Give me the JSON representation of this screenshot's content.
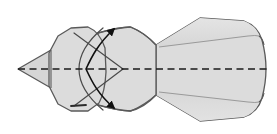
{
  "figure": {
    "description": "Line drawing of a folded paper form with a pointed left tip, a rounded octagonal head, a pinched waist and a flared fan-shaped tail at the right. A dashed horizontal centre line runs the full width and a curved double-headed arrow indicates the fold rotation.",
    "canvas": {
      "width": 277,
      "height": 134
    },
    "colors": {
      "background": "#ffffff",
      "paper_fill": "#dcdcdc",
      "paper_fill_light": "#e2e2e2",
      "paper_fill_shadow": "#d2d2d2",
      "outline": "#5a5a5a",
      "crease_line": "#9a9a9a",
      "arrow": "#111111",
      "center_line": "#1a1a1a"
    },
    "elements": [
      {
        "name": "left-tip-triangle",
        "kind": "filled-polygon",
        "label": "Pointed left tip",
        "points": "18,69 50,50 50,88"
      },
      {
        "name": "head-octagon",
        "kind": "filled-polygon",
        "label": "Rounded octagonal head",
        "points": "49,52 57,35 70,28 88,27 100,34 106,50 106,88 100,104 88,111 70,111 57,104 49,86"
      },
      {
        "name": "waist-body",
        "kind": "filled-polygon",
        "label": "Pinched waist body joining head to tail",
        "points": "100,34 130,27 156,45 200,18 246,22 266,45 268,69 266,94 246,116 200,121 156,95 130,111 100,104"
      },
      {
        "name": "tail-fan",
        "kind": "filled-polygon",
        "label": "Flared fan-shaped tail",
        "points": "156,45 200,18 246,22 262,36 266,69 262,102 246,116 200,121 156,95"
      },
      {
        "name": "tail-fold-upper",
        "kind": "crease-line",
        "label": "Upper fan crease",
        "points": "160,47 247,36 262,38"
      },
      {
        "name": "tail-fold-lower",
        "kind": "crease-line",
        "label": "Lower fan crease",
        "points": "160,93 247,104 262,102"
      },
      {
        "name": "head-vertical-crease",
        "kind": "crease-line",
        "label": "Vertical crease behind the tip",
        "points": "50,50 50,88"
      },
      {
        "name": "inner-chevron",
        "kind": "crease-line",
        "label": "Inner chevron crease pointing right",
        "points": "74,33 123,69 74,106"
      },
      {
        "name": "circle-arc-crease",
        "kind": "crease-line",
        "label": "Curved circular crease across the head",
        "points": "arc"
      },
      {
        "name": "center-dashed-line",
        "kind": "dashed-axis",
        "label": "Horizontal centre / symmetry axis",
        "from": [
          18,
          69
        ],
        "to": [
          268,
          69
        ]
      },
      {
        "name": "rotation-arrow",
        "kind": "double-headed-curved-arrow",
        "label": "Double-headed curved fold arrow",
        "upper_head": [
          114,
          27
        ],
        "lower_head": [
          114,
          110
        ]
      },
      {
        "name": "edge-tick-mark",
        "kind": "tick",
        "label": "Short edge tick mark at lower left of head",
        "from": [
          71,
          106
        ],
        "to": [
          86,
          105
        ]
      }
    ]
  }
}
